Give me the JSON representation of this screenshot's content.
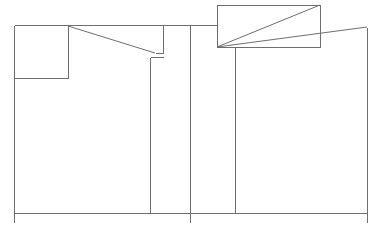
{
  "figure": {
    "type": "technical-line-drawing",
    "width": 381,
    "height": 234,
    "background_color": "#ffffff",
    "stroke_color": "#6e6e6e",
    "light_stroke_color": "#9a9a9a",
    "stroke_width": 1
  },
  "chart_data": {
    "type": "line",
    "title": "",
    "xlabel": "",
    "ylabel": "",
    "grid": false,
    "legend": "none",
    "xlim": [
      0,
      381
    ],
    "ylim": [
      0,
      234
    ],
    "shapes": [
      {
        "name": "baseline-horizontal",
        "kind": "polyline",
        "points": [
          [
            14,
            213
          ],
          [
            367,
            213
          ]
        ]
      },
      {
        "name": "top-horizontal-left",
        "kind": "polyline",
        "points": [
          [
            14,
            25
          ],
          [
            217,
            25
          ]
        ]
      },
      {
        "name": "left-outer-vertical",
        "kind": "polyline",
        "points": [
          [
            14,
            25
          ],
          [
            14,
            222
          ]
        ]
      },
      {
        "name": "small-box-top-left",
        "kind": "rect",
        "x": 14,
        "y": 25,
        "width": 54,
        "height": 53,
        "points": [
          [
            14,
            25
          ],
          [
            68,
            25
          ],
          [
            68,
            78
          ],
          [
            14,
            78
          ]
        ]
      },
      {
        "name": "small-box-right-vertical",
        "kind": "polyline",
        "points": [
          [
            68,
            25
          ],
          [
            68,
            78
          ]
        ]
      },
      {
        "name": "small-box-bottom-horizontal",
        "kind": "polyline",
        "points": [
          [
            14,
            78
          ],
          [
            68,
            78
          ]
        ]
      },
      {
        "name": "diagonal-upper-left",
        "kind": "polyline",
        "points": [
          [
            68,
            26
          ],
          [
            155,
            53
          ]
        ]
      },
      {
        "name": "notch-step-left",
        "kind": "polyline",
        "points": [
          [
            155,
            53
          ],
          [
            163,
            53
          ],
          [
            163,
            25
          ]
        ]
      },
      {
        "name": "notch-horizontal-left",
        "kind": "polyline",
        "points": [
          [
            150,
            57
          ],
          [
            163,
            57
          ]
        ]
      },
      {
        "name": "inner-vertical-a",
        "kind": "polyline",
        "points": [
          [
            150,
            57
          ],
          [
            150,
            213
          ]
        ]
      },
      {
        "name": "center-vertical",
        "kind": "polyline",
        "points": [
          [
            190,
            25
          ],
          [
            190,
            222
          ]
        ]
      },
      {
        "name": "right-upper-box",
        "kind": "rect",
        "x": 217,
        "y": 5,
        "width": 103,
        "height": 42,
        "points": [
          [
            217,
            5
          ],
          [
            320,
            5
          ],
          [
            320,
            47
          ],
          [
            217,
            47
          ]
        ]
      },
      {
        "name": "diagonal-right-inner",
        "kind": "polyline",
        "points": [
          [
            217,
            47
          ],
          [
            320,
            5
          ]
        ]
      },
      {
        "name": "diagonal-right-outer",
        "kind": "polyline",
        "points": [
          [
            217,
            47
          ],
          [
            367,
            27
          ]
        ]
      },
      {
        "name": "right-panel-vertical-left",
        "kind": "polyline",
        "points": [
          [
            235,
            47
          ],
          [
            235,
            213
          ]
        ]
      },
      {
        "name": "right-outer-vertical",
        "kind": "polyline",
        "points": [
          [
            367,
            27
          ],
          [
            367,
            222
          ]
        ]
      }
    ]
  }
}
